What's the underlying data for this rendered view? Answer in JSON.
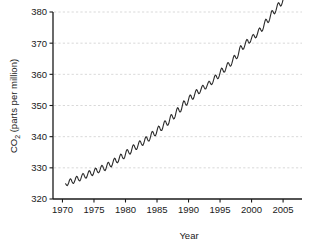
{
  "chart_data": {
    "type": "line",
    "title": "",
    "subtitle": "",
    "xlabel": "Year",
    "ylabel": "CO2 (parts per million)",
    "ylabel_parts": {
      "prefix": "CO",
      "subscript": "2",
      "suffix": " (parts per million)"
    },
    "xlim": [
      1968.5,
      2008.0
    ],
    "ylim": [
      320,
      380
    ],
    "xticks": [
      1970,
      1975,
      1980,
      1985,
      1990,
      1995,
      2000,
      2005
    ],
    "xtick_labels": [
      "1970",
      "1975",
      "1980",
      "1985",
      "1990",
      "1995",
      "2000",
      "2005"
    ],
    "yticks": [
      320,
      330,
      340,
      350,
      360,
      370,
      380
    ],
    "ytick_labels": [
      "320",
      "330",
      "340",
      "350",
      "360",
      "370",
      "380"
    ],
    "grid": {
      "horizontal": true,
      "vertical": false,
      "style": "dashed",
      "color": "#cfcfcf"
    },
    "legend": {
      "visible": false,
      "position": "none"
    },
    "line_color": "#2b2b2b",
    "line_width": 1.1,
    "series_name": "Atmospheric CO2 at Mauna Loa",
    "x": [
      1970.5,
      1970.625,
      1970.75,
      1970.875,
      1971.0,
      1971.125,
      1971.25,
      1971.375,
      1971.5,
      1971.625,
      1971.75,
      1971.875,
      1972.0,
      1972.125,
      1972.25,
      1972.375,
      1972.5,
      1972.625,
      1972.75,
      1972.875,
      1973.0,
      1973.125,
      1973.25,
      1973.375,
      1973.5,
      1973.625,
      1973.75,
      1973.875,
      1974.0,
      1974.125,
      1974.25,
      1974.375,
      1974.5,
      1974.625,
      1974.75,
      1974.875,
      1975.0,
      1975.125,
      1975.25,
      1975.375,
      1975.5,
      1975.625,
      1975.75,
      1975.875,
      1976.0,
      1976.125,
      1976.25,
      1976.375,
      1976.5,
      1976.625,
      1976.75,
      1976.875,
      1977.0,
      1977.125,
      1977.25,
      1977.375,
      1977.5,
      1977.625,
      1977.75,
      1977.875,
      1978.0,
      1978.125,
      1978.25,
      1978.375,
      1978.5,
      1978.625,
      1978.75,
      1978.875,
      1979.0,
      1979.125,
      1979.25,
      1979.375,
      1979.5,
      1979.625,
      1979.75,
      1979.875,
      1980.0,
      1980.125,
      1980.25,
      1980.375,
      1980.5,
      1980.625,
      1980.75,
      1980.875,
      1981.0,
      1981.125,
      1981.25,
      1981.375,
      1981.5,
      1981.625,
      1981.75,
      1981.875,
      1982.0,
      1982.125,
      1982.25,
      1982.375,
      1982.5,
      1982.625,
      1982.75,
      1982.875,
      1983.0,
      1983.125,
      1983.25,
      1983.375,
      1983.5,
      1983.625,
      1983.75,
      1983.875,
      1984.0,
      1984.125,
      1984.25,
      1984.375,
      1984.5,
      1984.625,
      1984.75,
      1984.875,
      1985.0,
      1985.125,
      1985.25,
      1985.375,
      1985.5,
      1985.625,
      1985.75,
      1985.875,
      1986.0,
      1986.125,
      1986.25,
      1986.375,
      1986.5,
      1986.625,
      1986.75,
      1986.875,
      1987.0,
      1987.125,
      1987.25,
      1987.375,
      1987.5,
      1987.625,
      1987.75,
      1987.875,
      1988.0,
      1988.125,
      1988.25,
      1988.375,
      1988.5,
      1988.625,
      1988.75,
      1988.875,
      1989.0,
      1989.125,
      1989.25,
      1989.375,
      1989.5,
      1989.625,
      1989.75,
      1989.875,
      1990.0,
      1990.125,
      1990.25,
      1990.375,
      1990.5,
      1990.625,
      1990.75,
      1990.875,
      1991.0,
      1991.125,
      1991.25,
      1991.375,
      1991.5,
      1991.625,
      1991.75,
      1991.875,
      1992.0,
      1992.125,
      1992.25,
      1992.375,
      1992.5,
      1992.625,
      1992.75,
      1992.875,
      1993.0,
      1993.125,
      1993.25,
      1993.375,
      1993.5,
      1993.625,
      1993.75,
      1993.875,
      1994.0,
      1994.125,
      1994.25,
      1994.375,
      1994.5,
      1994.625,
      1994.75,
      1994.875,
      1995.0,
      1995.125,
      1995.25,
      1995.375,
      1995.5,
      1995.625,
      1995.75,
      1995.875,
      1996.0,
      1996.125,
      1996.25,
      1996.375,
      1996.5,
      1996.625,
      1996.75,
      1996.875,
      1997.0,
      1997.125,
      1997.25,
      1997.375,
      1997.5,
      1997.625,
      1997.75,
      1997.875,
      1998.0,
      1998.125,
      1998.25,
      1998.375,
      1998.5,
      1998.625,
      1998.75,
      1998.875,
      1999.0,
      1999.125,
      1999.25,
      1999.375,
      1999.5,
      1999.625,
      1999.75,
      1999.875,
      2000.0,
      2000.125,
      2000.25,
      2000.375,
      2000.5,
      2000.625,
      2000.75,
      2000.875,
      2001.0,
      2001.125,
      2001.25,
      2001.375,
      2001.5,
      2001.625,
      2001.75,
      2001.875,
      2002.0,
      2002.125,
      2002.25,
      2002.375,
      2002.5,
      2002.625,
      2002.75,
      2002.875,
      2003.0,
      2003.125,
      2003.25,
      2003.375,
      2003.5,
      2003.625,
      2003.75,
      2003.875,
      2004.0,
      2004.125,
      2004.25,
      2004.375,
      2004.5,
      2004.625,
      2004.75,
      2004.875,
      2005.0,
      2005.125,
      2005.25,
      2005.375,
      2005.5,
      2005.625,
      2005.75,
      2005.875,
      2006.0,
      2006.125,
      2006.25,
      2006.375,
      2006.5,
      2006.625,
      2006.75,
      2006.875,
      2007.0,
      2007.125,
      2007.25,
      2007.375
    ],
    "y": [
      324.9,
      324.5,
      324.3,
      324.6,
      325.3,
      326.1,
      326.5,
      326.3,
      325.6,
      325.1,
      325.0,
      325.4,
      326.1,
      326.9,
      327.3,
      327.1,
      326.4,
      325.9,
      325.8,
      326.2,
      327.0,
      327.8,
      328.2,
      328.0,
      327.3,
      326.8,
      326.7,
      327.1,
      327.9,
      328.7,
      329.1,
      328.9,
      328.2,
      327.7,
      327.5,
      327.9,
      328.7,
      329.5,
      329.9,
      329.7,
      329.0,
      328.5,
      328.4,
      328.8,
      329.6,
      330.4,
      330.8,
      330.6,
      329.9,
      329.3,
      329.1,
      329.5,
      330.4,
      331.3,
      331.8,
      331.6,
      330.9,
      330.4,
      330.3,
      330.8,
      331.7,
      332.6,
      333.1,
      332.9,
      332.2,
      331.7,
      331.6,
      332.1,
      333.0,
      333.9,
      334.4,
      334.2,
      333.5,
      333.0,
      332.9,
      333.4,
      334.4,
      335.4,
      335.9,
      335.7,
      335.0,
      334.5,
      334.4,
      334.9,
      335.9,
      336.9,
      337.4,
      337.2,
      336.5,
      336.0,
      335.9,
      336.4,
      337.3,
      338.2,
      338.7,
      338.5,
      337.8,
      337.3,
      337.2,
      337.7,
      338.6,
      339.5,
      340.0,
      339.8,
      339.1,
      338.6,
      338.6,
      339.2,
      340.2,
      341.2,
      341.7,
      341.5,
      340.8,
      340.3,
      340.3,
      340.9,
      341.9,
      342.9,
      343.4,
      343.2,
      342.5,
      342.0,
      342.0,
      342.6,
      343.6,
      344.6,
      345.1,
      344.9,
      344.2,
      343.7,
      343.7,
      344.3,
      345.4,
      346.5,
      347.1,
      346.9,
      346.2,
      345.7,
      345.8,
      346.5,
      347.6,
      348.7,
      349.3,
      349.1,
      348.4,
      347.9,
      348.0,
      348.7,
      349.8,
      350.9,
      351.5,
      351.3,
      350.6,
      350.1,
      350.2,
      350.9,
      351.9,
      352.9,
      353.4,
      353.2,
      352.5,
      352.0,
      352.1,
      352.8,
      353.7,
      354.6,
      355.1,
      354.9,
      354.2,
      353.8,
      353.9,
      354.5,
      355.3,
      356.1,
      356.5,
      356.3,
      355.7,
      355.3,
      355.4,
      356.0,
      356.7,
      357.4,
      357.8,
      357.6,
      357.0,
      356.7,
      356.9,
      357.5,
      358.4,
      359.3,
      359.8,
      359.6,
      359.0,
      358.6,
      358.8,
      359.5,
      360.5,
      361.5,
      362.0,
      361.8,
      361.1,
      360.7,
      360.8,
      361.5,
      362.4,
      363.3,
      363.8,
      363.6,
      363.0,
      362.6,
      362.8,
      363.5,
      364.5,
      365.5,
      366.1,
      365.9,
      365.3,
      365.0,
      365.3,
      366.1,
      367.3,
      368.5,
      369.2,
      369.0,
      368.4,
      368.0,
      368.2,
      368.9,
      369.8,
      370.7,
      371.2,
      371.0,
      370.4,
      370.0,
      370.2,
      370.8,
      371.6,
      372.4,
      372.8,
      372.6,
      372.0,
      371.7,
      371.9,
      372.6,
      373.5,
      374.4,
      374.9,
      374.7,
      374.1,
      373.8,
      374.1,
      374.9,
      376.0,
      377.1,
      377.7,
      377.5,
      376.9,
      376.6,
      376.9,
      377.7,
      378.8,
      379.9,
      380.5,
      380.3,
      379.7,
      379.4,
      379.7,
      380.5,
      381.5,
      382.5,
      383.0,
      382.8,
      382.2,
      381.9,
      382.2,
      383.0,
      384.0,
      385.0,
      385.6,
      385.4
    ],
    "annotations": []
  },
  "figure": {
    "background_color": "#ffffff",
    "axis_color": "#1a1a1a",
    "text_color": "#1a1a1a"
  }
}
